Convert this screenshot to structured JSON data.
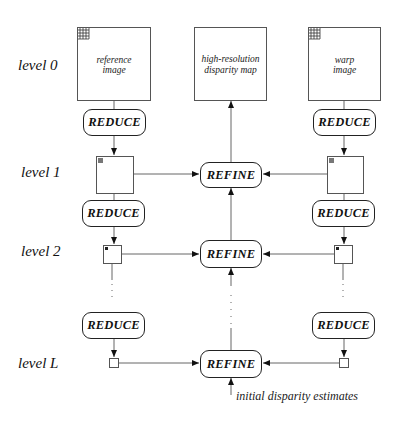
{
  "diagram": {
    "levels": [
      "level 0",
      "level 1",
      "level 2",
      "level L"
    ],
    "top_boxes": {
      "reference": "reference image",
      "reference_l1": "reference",
      "reference_l2": "image",
      "output_l1": "high-resolution",
      "output_l2": "disparity map",
      "warp_l1": "warp",
      "warp_l2": "image"
    },
    "reduce_label": "REDUCE",
    "refine_label": "REFINE",
    "initial_note": "initial disparity estimates",
    "colors": {
      "line": "#555555",
      "text": "#111111",
      "background": "#ffffff"
    }
  }
}
